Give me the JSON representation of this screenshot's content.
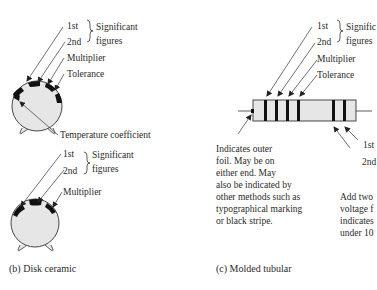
{
  "disk_top": {
    "labels": {
      "first": "1st",
      "second": "2nd",
      "significant_line1": "Significant",
      "significant_line2": "figures",
      "multiplier": "Multiplier",
      "tolerance": "Tolerance",
      "temperature_coefficient": "Temperature coefficient"
    }
  },
  "disk_bottom": {
    "labels": {
      "first": "1st",
      "second": "2nd",
      "significant_line1": "Significant",
      "significant_line2": "figures",
      "multiplier": "Multiplier"
    },
    "caption": "(b) Disk ceramic"
  },
  "tubular": {
    "labels": {
      "first": "1st",
      "second": "2nd",
      "significant_line1": "Signific",
      "significant_line2": "figures",
      "multiplier": "Multiplier",
      "tolerance": "Tolerance",
      "right_first": "1st",
      "right_second": "2nd"
    },
    "outer_foil_note": [
      "Indicates outer",
      "foil.  May be on",
      "either end.  May",
      "also be indicated by",
      "other methods such as",
      "typographical marking",
      "or black stripe."
    ],
    "voltage_note": [
      "Add two",
      "voltage f",
      "indicates",
      "under 10"
    ],
    "caption": "(c) Molded tubular"
  },
  "colors": {
    "body_fill": "#e6e6e6",
    "band": "#111111",
    "line": "#333333"
  }
}
